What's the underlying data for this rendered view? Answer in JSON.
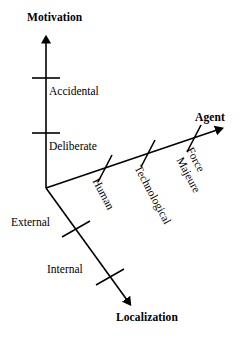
{
  "figure": {
    "kind": "3d-axes-taxonomy-diagram",
    "background_color": "#ffffff",
    "stroke_color": "#000000",
    "origin": {
      "x": 46,
      "y": 188
    }
  },
  "axes": {
    "motivation": {
      "title": "Motivation",
      "direction": "up",
      "start": {
        "x": 46,
        "y": 188
      },
      "end": {
        "x": 46,
        "y": 37
      },
      "ticks": [
        {
          "label": "Accidental",
          "at": {
            "x": 46,
            "y": 78
          }
        },
        {
          "label": "Deliberate",
          "at": {
            "x": 46,
            "y": 133
          }
        }
      ]
    },
    "agent": {
      "title": "Agent",
      "direction": "up-right",
      "start": {
        "x": 46,
        "y": 188
      },
      "end": {
        "x": 222,
        "y": 128
      },
      "ticks": [
        {
          "label": "Human",
          "at": {
            "x": 105,
            "y": 168
          }
        },
        {
          "label": "Technological",
          "at": {
            "x": 148,
            "y": 153
          }
        },
        {
          "label": "Force Majeure",
          "at": {
            "x": 194,
            "y": 138
          }
        }
      ]
    },
    "localization": {
      "title": "Localization",
      "direction": "down-right",
      "start": {
        "x": 46,
        "y": 188
      },
      "end": {
        "x": 131,
        "y": 306
      },
      "ticks": [
        {
          "label": "External",
          "at": {
            "x": 76,
            "y": 229
          }
        },
        {
          "label": "Internal",
          "at": {
            "x": 110,
            "y": 277
          }
        }
      ]
    }
  },
  "labels": {
    "motivation_title": "Motivation",
    "agent_title": "Agent",
    "localization_title": "Localization",
    "accidental": "Accidental",
    "deliberate": "Deliberate",
    "external": "External",
    "internal": "Internal",
    "human": "Human",
    "technological": "Technological",
    "force": "Force",
    "majeure": "Majeure"
  }
}
